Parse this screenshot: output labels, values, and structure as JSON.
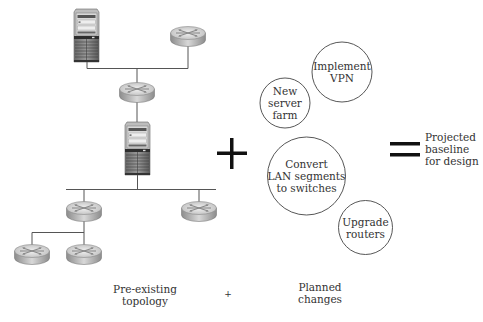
{
  "diagram": {
    "topology": {
      "nodes": [
        {
          "id": "server-top",
          "type": "server",
          "x": 74,
          "y": 9,
          "w": 25,
          "h": 53
        },
        {
          "id": "router-top-right",
          "type": "router",
          "cx": 188,
          "cy": 36
        },
        {
          "id": "router-middle",
          "type": "router",
          "cx": 137,
          "cy": 92
        },
        {
          "id": "server-middle",
          "type": "server",
          "x": 125,
          "y": 122,
          "w": 25,
          "h": 53
        },
        {
          "id": "router-lan-left",
          "type": "router",
          "cx": 84,
          "cy": 211
        },
        {
          "id": "router-lan-right",
          "type": "router",
          "cx": 199,
          "cy": 211
        },
        {
          "id": "router-sub-left",
          "type": "router",
          "cx": 32,
          "cy": 254
        },
        {
          "id": "router-sub-right",
          "type": "router",
          "cx": 84,
          "cy": 254
        }
      ]
    },
    "operators": {
      "plus_big": "+",
      "equals_big": "=",
      "plus_small": "+"
    },
    "planned_changes": [
      {
        "id": "new-server-farm",
        "lines": [
          "New",
          "server",
          "farm"
        ],
        "cx": 285,
        "cy": 103,
        "r": 25
      },
      {
        "id": "implement-vpn",
        "lines": [
          "Implement",
          "VPN"
        ],
        "cx": 342,
        "cy": 72,
        "r": 30
      },
      {
        "id": "convert-lan",
        "lines": [
          "Convert",
          "LAN segments",
          "to switches"
        ],
        "cx": 306,
        "cy": 176,
        "r": 39
      },
      {
        "id": "upgrade-routers",
        "lines": [
          "Upgrade",
          "routers"
        ],
        "cx": 365,
        "cy": 227,
        "r": 27
      }
    ],
    "result": {
      "lines": [
        "Projected",
        "baseline",
        "for design"
      ]
    },
    "captions": {
      "pre_existing": [
        "Pre-existing",
        "topology"
      ],
      "plus": "+",
      "planned": [
        "Planned",
        "changes"
      ]
    }
  }
}
